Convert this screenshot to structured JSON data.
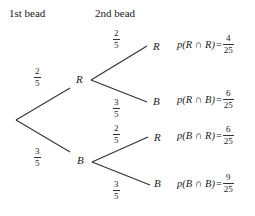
{
  "headers": {
    "first": "1st bead",
    "second": "2nd bead"
  },
  "level1": {
    "upper": {
      "node": "R",
      "prob": {
        "num": "2",
        "den": "5"
      }
    },
    "lower": {
      "node": "B",
      "prob": {
        "num": "3",
        "den": "5"
      }
    }
  },
  "level2": {
    "R": {
      "upper": {
        "node": "R",
        "prob": {
          "num": "2",
          "den": "5"
        }
      },
      "lower": {
        "node": "B",
        "prob": {
          "num": "3",
          "den": "5"
        }
      }
    },
    "B": {
      "upper": {
        "node": "R",
        "prob": {
          "num": "2",
          "den": "5"
        }
      },
      "lower": {
        "node": "B",
        "prob": {
          "num": "3",
          "den": "5"
        }
      }
    }
  },
  "results": [
    {
      "label": "p(R ∩ R)",
      "eq": "=",
      "num": "4",
      "den": "25"
    },
    {
      "label": "p(R ∩ B)",
      "eq": "=",
      "num": "6",
      "den": "25"
    },
    {
      "label": "p(B ∩ R)",
      "eq": "=",
      "num": "6",
      "den": "25"
    },
    {
      "label": "p(B ∩ B)",
      "eq": "=",
      "num": "9",
      "den": "25"
    }
  ],
  "colors": {
    "ink": "#222222",
    "background": "#ffffff"
  }
}
